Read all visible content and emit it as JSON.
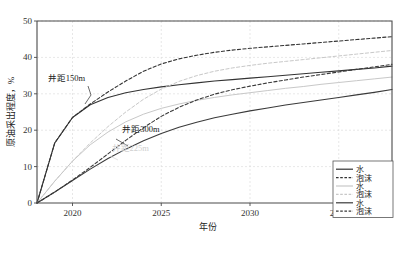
{
  "chart_data": {
    "type": "line",
    "title": "",
    "xlabel": "年份",
    "ylabel": "原油采出程度，%",
    "xlim": [
      2018,
      2038
    ],
    "ylim": [
      0,
      50
    ],
    "xticks": [
      "2020",
      "2025",
      "2030",
      "2035"
    ],
    "xtick_values": [
      2020,
      2025,
      2030,
      2035
    ],
    "yticks": [
      "0",
      "10",
      "20",
      "30",
      "40",
      "50"
    ],
    "ytick_values": [
      0,
      10,
      20,
      30,
      40,
      50
    ],
    "grid": true,
    "legend_position": "bottom-right",
    "x": [
      2018,
      2019,
      2020,
      2021,
      2022,
      2023,
      2024,
      2025,
      2026,
      2027,
      2028,
      2029,
      2030,
      2031,
      2032,
      2033,
      2034,
      2035,
      2036,
      2037,
      2038
    ],
    "series": [
      {
        "name": "水",
        "label": "水",
        "well_spacing": "井距150m",
        "style": "solid",
        "color": "#333333",
        "values": [
          0,
          16.5,
          23.5,
          27.0,
          29.0,
          30.3,
          31.2,
          31.9,
          32.5,
          33.0,
          33.5,
          33.9,
          34.3,
          34.7,
          35.1,
          35.5,
          35.9,
          36.3,
          36.7,
          37.1,
          37.6
        ]
      },
      {
        "name": "泡沫",
        "label": "泡沫",
        "well_spacing": "井距150m",
        "style": "dashed",
        "color": "#333333",
        "values": [
          0,
          16.5,
          23.5,
          27.2,
          30.5,
          33.5,
          36.2,
          38.2,
          39.6,
          40.6,
          41.4,
          42.0,
          42.5,
          42.9,
          43.3,
          43.7,
          44.1,
          44.5,
          44.9,
          45.3,
          45.7
        ]
      },
      {
        "name": "水",
        "label": "水",
        "well_spacing": "井距225m",
        "style": "solid",
        "color": "#c8c8c8",
        "values": [
          0,
          6.0,
          11.5,
          16.0,
          19.5,
          22.3,
          24.4,
          26.0,
          27.2,
          28.2,
          29.0,
          29.7,
          30.3,
          30.9,
          31.5,
          32.0,
          32.6,
          33.1,
          33.6,
          34.1,
          34.6
        ]
      },
      {
        "name": "泡沫",
        "label": "泡沫",
        "well_spacing": "井距225m",
        "style": "dashed",
        "color": "#c8c8c8",
        "values": [
          0,
          6.0,
          11.5,
          16.5,
          21.0,
          25.0,
          28.5,
          31.3,
          33.4,
          35.0,
          36.2,
          37.1,
          37.8,
          38.4,
          38.9,
          39.4,
          39.9,
          40.4,
          40.9,
          41.4,
          41.9
        ]
      },
      {
        "name": "水",
        "label": "水",
        "well_spacing": "井距300m",
        "style": "solid",
        "color": "#3a3a3a",
        "values": [
          0,
          3.0,
          6.2,
          9.3,
          12.2,
          14.8,
          17.1,
          19.1,
          20.8,
          22.2,
          23.4,
          24.4,
          25.3,
          26.1,
          26.9,
          27.6,
          28.3,
          29.0,
          29.7,
          30.4,
          31.2
        ]
      },
      {
        "name": "泡沫",
        "label": "泡沫",
        "well_spacing": "井距300m",
        "style": "dashed",
        "color": "#3a3a3a",
        "values": [
          0,
          3.0,
          6.3,
          9.8,
          13.5,
          17.2,
          20.7,
          23.8,
          26.3,
          28.3,
          29.9,
          31.1,
          32.1,
          33.0,
          33.8,
          34.6,
          35.3,
          36.0,
          36.7,
          37.4,
          38.1
        ]
      }
    ],
    "annotations": [
      {
        "text": "井距150m",
        "x": 2018.6,
        "y": 33.5,
        "style": "dark"
      },
      {
        "text": "井距300m",
        "x": 2022.8,
        "y": 19.5,
        "style": "dark"
      },
      {
        "text": "井距225m",
        "x": 2022.2,
        "y": 14.2,
        "style": "faded"
      }
    ]
  },
  "legend": {
    "items": [
      {
        "label": "水",
        "style": "solid",
        "color": "#333333"
      },
      {
        "label": "泡沫",
        "style": "dashed",
        "color": "#333333"
      },
      {
        "label": "水",
        "style": "solid",
        "color": "#c8c8c8"
      },
      {
        "label": "泡沫",
        "style": "dashed",
        "color": "#c8c8c8"
      },
      {
        "label": "水",
        "style": "solid",
        "color": "#3a3a3a"
      },
      {
        "label": "泡沫",
        "style": "dashed",
        "color": "#3a3a3a"
      }
    ]
  },
  "caption": {
    "text": ""
  }
}
